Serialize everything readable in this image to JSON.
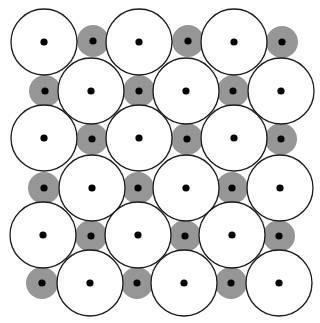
{
  "figure": {
    "title": "",
    "width": 320,
    "height": 323,
    "background_color": "#ffffff"
  },
  "style": {
    "large_circle_fill": "#ffffff",
    "large_circle_stroke": "#1a1a1a",
    "large_circle_stroke_width": 1.3,
    "large_circle_radius": 33,
    "small_circle_fill": "#969696",
    "small_circle_stroke": "none",
    "small_circle_radius": 16,
    "center_dot_fill": "#000000",
    "center_dot_radius": 3.6
  },
  "chart_data": {
    "type": "scatter",
    "title": "",
    "xlabel": "",
    "ylabel": "",
    "xlim": [
      0,
      320
    ],
    "ylim": [
      0,
      323
    ],
    "grid": false,
    "legend": null,
    "lattice": {
      "rows": 6,
      "columns": 6,
      "row_spacing": 48,
      "column_spacing": 47.5,
      "pattern": "checkerboard-alternating",
      "first_row_y": 42,
      "first_column_x": 44
    },
    "series": [
      {
        "name": "large-atom",
        "marker": "open-circle",
        "radius": 33,
        "fill": "#ffffff",
        "edge": "#1a1a1a",
        "points": [
          {
            "x": 44,
            "y": 42
          },
          {
            "x": 139,
            "y": 42
          },
          {
            "x": 234,
            "y": 42
          },
          {
            "x": 91,
            "y": 91
          },
          {
            "x": 186,
            "y": 91
          },
          {
            "x": 281,
            "y": 91
          },
          {
            "x": 44,
            "y": 138
          },
          {
            "x": 139,
            "y": 138
          },
          {
            "x": 234,
            "y": 138
          },
          {
            "x": 92,
            "y": 188
          },
          {
            "x": 186,
            "y": 188
          },
          {
            "x": 280,
            "y": 188
          },
          {
            "x": 43,
            "y": 235
          },
          {
            "x": 138,
            "y": 235
          },
          {
            "x": 232,
            "y": 235
          },
          {
            "x": 90,
            "y": 283
          },
          {
            "x": 184,
            "y": 283
          },
          {
            "x": 279,
            "y": 283
          }
        ]
      },
      {
        "name": "small-atom",
        "marker": "filled-circle",
        "radius": 16,
        "fill": "#969696",
        "edge": "none",
        "points": [
          {
            "x": 93,
            "y": 41
          },
          {
            "x": 188,
            "y": 41
          },
          {
            "x": 282,
            "y": 42
          },
          {
            "x": 45,
            "y": 91
          },
          {
            "x": 139,
            "y": 91
          },
          {
            "x": 233,
            "y": 91
          },
          {
            "x": 92,
            "y": 139
          },
          {
            "x": 187,
            "y": 139
          },
          {
            "x": 281,
            "y": 139
          },
          {
            "x": 44,
            "y": 188
          },
          {
            "x": 138,
            "y": 188
          },
          {
            "x": 232,
            "y": 188
          },
          {
            "x": 91,
            "y": 236
          },
          {
            "x": 185,
            "y": 236
          },
          {
            "x": 279,
            "y": 236
          },
          {
            "x": 42,
            "y": 283
          },
          {
            "x": 137,
            "y": 283
          },
          {
            "x": 231,
            "y": 283
          }
        ]
      },
      {
        "name": "center-dot",
        "marker": "dot",
        "radius": 3.6,
        "fill": "#000000",
        "edge": "none",
        "points": [
          {
            "x": 44,
            "y": 42
          },
          {
            "x": 93,
            "y": 41
          },
          {
            "x": 139,
            "y": 42
          },
          {
            "x": 188,
            "y": 41
          },
          {
            "x": 234,
            "y": 42
          },
          {
            "x": 282,
            "y": 42
          },
          {
            "x": 45,
            "y": 91
          },
          {
            "x": 91,
            "y": 91
          },
          {
            "x": 139,
            "y": 91
          },
          {
            "x": 186,
            "y": 91
          },
          {
            "x": 233,
            "y": 91
          },
          {
            "x": 281,
            "y": 91
          },
          {
            "x": 44,
            "y": 138
          },
          {
            "x": 92,
            "y": 139
          },
          {
            "x": 139,
            "y": 138
          },
          {
            "x": 187,
            "y": 139
          },
          {
            "x": 234,
            "y": 138
          },
          {
            "x": 281,
            "y": 139
          },
          {
            "x": 44,
            "y": 188
          },
          {
            "x": 92,
            "y": 188
          },
          {
            "x": 138,
            "y": 188
          },
          {
            "x": 186,
            "y": 188
          },
          {
            "x": 232,
            "y": 188
          },
          {
            "x": 280,
            "y": 188
          },
          {
            "x": 43,
            "y": 235
          },
          {
            "x": 91,
            "y": 236
          },
          {
            "x": 138,
            "y": 235
          },
          {
            "x": 185,
            "y": 236
          },
          {
            "x": 232,
            "y": 235
          },
          {
            "x": 279,
            "y": 236
          },
          {
            "x": 42,
            "y": 283
          },
          {
            "x": 90,
            "y": 283
          },
          {
            "x": 137,
            "y": 283
          },
          {
            "x": 184,
            "y": 283
          },
          {
            "x": 231,
            "y": 283
          },
          {
            "x": 279,
            "y": 283
          }
        ]
      }
    ]
  }
}
